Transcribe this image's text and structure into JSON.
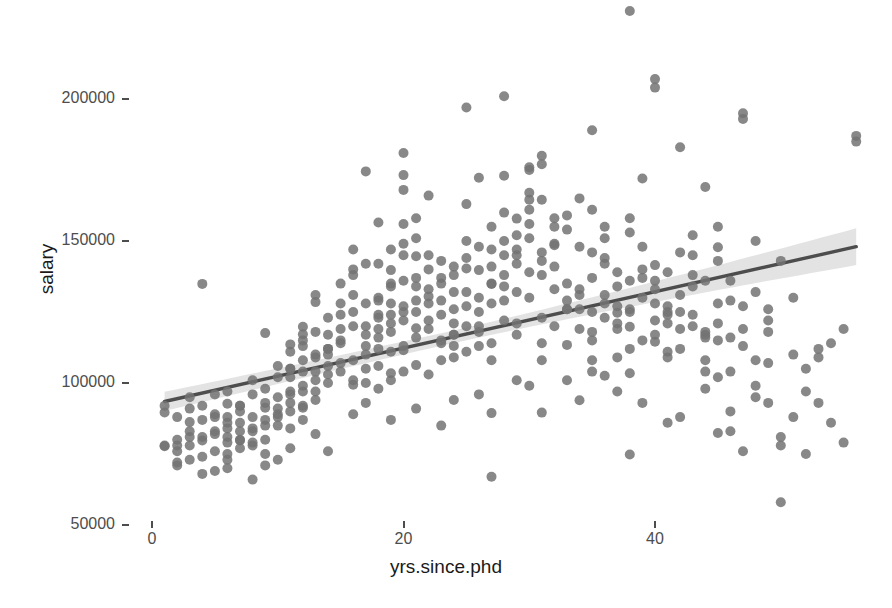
{
  "chart_data": {
    "type": "scatter",
    "title": "",
    "xlabel": "yrs.since.phd",
    "ylabel": "salary",
    "xlim": [
      -1.5,
      57.5
    ],
    "ylim": [
      45000,
      235000
    ],
    "x_ticks": [
      0,
      20,
      40
    ],
    "x_tick_labels": [
      "0",
      "20",
      "40"
    ],
    "y_ticks": [
      50000,
      100000,
      150000,
      200000
    ],
    "y_tick_labels": [
      "50000",
      "100000",
      "150000",
      "200000"
    ],
    "grid": false,
    "legend": "none",
    "point_color": "#737373",
    "point_opacity": 0.85,
    "point_radius": 5,
    "smooth": {
      "method": "lm",
      "line_color": "#4d4d4d",
      "band_color": "#d9d9d9",
      "x_start": 1,
      "x_end": 56,
      "y_start": 93500,
      "y_end": 148000,
      "band_halfwidth_start": 4200,
      "band_halfwidth_mid": 2200,
      "band_halfwidth_end": 6500
    },
    "points": [
      [
        19,
        139750
      ],
      [
        20,
        173200
      ],
      [
        4,
        79750
      ],
      [
        45,
        115000
      ],
      [
        40,
        141500
      ],
      [
        6,
        97000
      ],
      [
        30,
        175000
      ],
      [
        45,
        147765
      ],
      [
        21,
        119250
      ],
      [
        18,
        129000
      ],
      [
        12,
        119800
      ],
      [
        7,
        79800
      ],
      [
        1,
        77700
      ],
      [
        2,
        78000
      ],
      [
        20,
        104000
      ],
      [
        12,
        117150
      ],
      [
        19,
        101000
      ],
      [
        38,
        103450
      ],
      [
        37,
        124750
      ],
      [
        39,
        137000
      ],
      [
        31,
        89565
      ],
      [
        36,
        102580
      ],
      [
        34,
        93904
      ],
      [
        24,
        113068
      ],
      [
        38,
        74830
      ],
      [
        21,
        106294
      ],
      [
        4,
        134885
      ],
      [
        45,
        82379
      ],
      [
        11,
        77000
      ],
      [
        3,
        86250
      ],
      [
        11,
        113600
      ],
      [
        6,
        92700
      ],
      [
        1,
        89600
      ],
      [
        8,
        101000
      ],
      [
        12,
        91300
      ],
      [
        6,
        88000
      ],
      [
        40,
        114500
      ],
      [
        20,
        125000
      ],
      [
        26,
        139750
      ],
      [
        17,
        174500
      ],
      [
        9,
        117555
      ],
      [
        41,
        123999
      ],
      [
        13,
        128500
      ],
      [
        18,
        156500
      ],
      [
        30,
        151000
      ],
      [
        19,
        135000
      ],
      [
        29,
        101000
      ],
      [
        16,
        99418
      ],
      [
        20,
        111512
      ],
      [
        9,
        91300
      ],
      [
        2,
        88000
      ],
      [
        41,
        125000
      ],
      [
        38,
        119800
      ],
      [
        11,
        105000
      ],
      [
        5,
        96000
      ],
      [
        22,
        130500
      ],
      [
        33,
        113400
      ],
      [
        27,
        89400
      ],
      [
        40,
        136000
      ],
      [
        25,
        140300
      ],
      [
        19,
        103400
      ],
      [
        10,
        89000
      ],
      [
        27,
        134885
      ],
      [
        44,
        136000
      ],
      [
        17,
        105000
      ],
      [
        16,
        101000
      ],
      [
        24,
        117000
      ],
      [
        3,
        95000
      ],
      [
        28,
        145000
      ],
      [
        32,
        148500
      ],
      [
        7,
        92000
      ],
      [
        14,
        112000
      ],
      [
        21,
        144651
      ],
      [
        35,
        108000
      ],
      [
        12,
        97000
      ],
      [
        48,
        150000
      ],
      [
        38,
        125000
      ],
      [
        42,
        119000
      ],
      [
        29,
        157875
      ],
      [
        18,
        124000
      ],
      [
        6,
        81000
      ],
      [
        23,
        114000
      ],
      [
        31,
        164500
      ],
      [
        36,
        155000
      ],
      [
        49,
        93000
      ],
      [
        13,
        110000
      ],
      [
        11,
        105000
      ],
      [
        8,
        78000
      ],
      [
        26,
        172272
      ],
      [
        20,
        145000
      ],
      [
        16,
        138000
      ],
      [
        5,
        83000
      ],
      [
        33,
        126000
      ],
      [
        43,
        138000
      ],
      [
        27,
        108000
      ],
      [
        18,
        119000
      ],
      [
        22,
        128000
      ],
      [
        35,
        146000
      ],
      [
        11,
        97000
      ],
      [
        15,
        115000
      ],
      [
        30,
        164500
      ],
      [
        41,
        121000
      ],
      [
        9,
        85000
      ],
      [
        7,
        90000
      ],
      [
        24,
        132000
      ],
      [
        28,
        150000
      ],
      [
        37,
        134000
      ],
      [
        19,
        121000
      ],
      [
        13,
        104000
      ],
      [
        4,
        92000
      ],
      [
        46,
        129000
      ],
      [
        21,
        158000
      ],
      [
        25,
        127000
      ],
      [
        34,
        119000
      ],
      [
        10,
        95000
      ],
      [
        17,
        113000
      ],
      [
        39,
        172000
      ],
      [
        23,
        135000
      ],
      [
        32,
        155000
      ],
      [
        14,
        100000
      ],
      [
        6,
        79000
      ],
      [
        29,
        142000
      ],
      [
        44,
        117000
      ],
      [
        12,
        108000
      ],
      [
        20,
        149000
      ],
      [
        36,
        131000
      ],
      [
        8,
        84000
      ],
      [
        26,
        120000
      ],
      [
        47,
        195000
      ],
      [
        15,
        124000
      ],
      [
        22,
        166000
      ],
      [
        31,
        138000
      ],
      [
        5,
        76000
      ],
      [
        18,
        130000
      ],
      [
        40,
        204000
      ],
      [
        11,
        93000
      ],
      [
        27,
        147000
      ],
      [
        38,
        112000
      ],
      [
        16,
        140000
      ],
      [
        3,
        81000
      ],
      [
        33,
        126000
      ],
      [
        42,
        183000
      ],
      [
        24,
        109000
      ],
      [
        9,
        87000
      ],
      [
        30,
        176000
      ],
      [
        13,
        118000
      ],
      [
        45,
        128000
      ],
      [
        21,
        151000
      ],
      [
        35,
        125000
      ],
      [
        7,
        83000
      ],
      [
        19,
        111000
      ],
      [
        28,
        134000
      ],
      [
        43,
        145000
      ],
      [
        1,
        78000
      ],
      [
        25,
        163000
      ],
      [
        37,
        121000
      ],
      [
        14,
        103000
      ],
      [
        32,
        158000
      ],
      [
        10,
        91000
      ],
      [
        49,
        107000
      ],
      [
        23,
        143000
      ],
      [
        41,
        139000
      ],
      [
        17,
        128000
      ],
      [
        4,
        74000
      ],
      [
        29,
        117000
      ],
      [
        34,
        148000
      ],
      [
        12,
        99000
      ],
      [
        20,
        168000
      ],
      [
        46,
        90000
      ],
      [
        8,
        88000
      ],
      [
        26,
        130000
      ],
      [
        39,
        115000
      ],
      [
        15,
        135000
      ],
      [
        2,
        80000
      ],
      [
        31,
        180000
      ],
      [
        44,
        108000
      ],
      [
        22,
        122000
      ],
      [
        36,
        142000
      ],
      [
        11,
        102000
      ],
      [
        6,
        86000
      ],
      [
        27,
        155000
      ],
      [
        48,
        95000
      ],
      [
        18,
        116000
      ],
      [
        40,
        133000
      ],
      [
        13,
        94000
      ],
      [
        30,
        161000
      ],
      [
        24,
        126000
      ],
      [
        9,
        80000
      ],
      [
        42,
        112000
      ],
      [
        16,
        147000
      ],
      [
        33,
        129000
      ],
      [
        21,
        137000
      ],
      [
        5,
        89000
      ],
      [
        28,
        173000
      ],
      [
        47,
        119000
      ],
      [
        19,
        124000
      ],
      [
        38,
        153000
      ],
      [
        14,
        110000
      ],
      [
        35,
        118000
      ],
      [
        7,
        77000
      ],
      [
        25,
        144000
      ],
      [
        45,
        102000
      ],
      [
        10,
        106000
      ],
      [
        29,
        132000
      ],
      [
        50,
        78000
      ],
      [
        23,
        115000
      ],
      [
        41,
        127000
      ],
      [
        17,
        120000
      ],
      [
        3,
        83000
      ],
      [
        32,
        141000
      ],
      [
        12,
        113000
      ],
      [
        46,
        136000
      ],
      [
        20,
        156000
      ],
      [
        37,
        109000
      ],
      [
        8,
        96000
      ],
      [
        27,
        128000
      ],
      [
        51,
        110000
      ],
      [
        15,
        107000
      ],
      [
        34,
        165000
      ],
      [
        22,
        133000
      ],
      [
        43,
        124000
      ],
      [
        11,
        90000
      ],
      [
        31,
        146000
      ],
      [
        6,
        75000
      ],
      [
        26,
        118000
      ],
      [
        52,
        105000
      ],
      [
        18,
        142000
      ],
      [
        39,
        130000
      ],
      [
        13,
        101000
      ],
      [
        36,
        151000
      ],
      [
        24,
        121000
      ],
      [
        4,
        87000
      ],
      [
        30,
        139000
      ],
      [
        48,
        99000
      ],
      [
        16,
        125000
      ],
      [
        44,
        116000
      ],
      [
        21,
        129000
      ],
      [
        9,
        98000
      ],
      [
        28,
        160000
      ],
      [
        53,
        93000
      ],
      [
        19,
        134000
      ],
      [
        40,
        122000
      ],
      [
        14,
        112000
      ],
      [
        33,
        154000
      ],
      [
        23,
        108000
      ],
      [
        5,
        82000
      ],
      [
        29,
        145000
      ],
      [
        49,
        126000
      ],
      [
        17,
        117000
      ],
      [
        42,
        131000
      ],
      [
        12,
        104000
      ],
      [
        35,
        137000
      ],
      [
        25,
        150000
      ],
      [
        10,
        85000
      ],
      [
        31,
        123000
      ],
      [
        54,
        86000
      ],
      [
        20,
        113000
      ],
      [
        45,
        143000
      ],
      [
        15,
        119000
      ],
      [
        37,
        127000
      ],
      [
        22,
        140000
      ],
      [
        7,
        92000
      ],
      [
        27,
        114000
      ],
      [
        50,
        81000
      ],
      [
        18,
        106000
      ],
      [
        38,
        158000
      ],
      [
        13,
        97000
      ],
      [
        34,
        133000
      ],
      [
        26,
        125000
      ],
      [
        2,
        76000
      ],
      [
        32,
        149000
      ],
      [
        47,
        113000
      ],
      [
        16,
        131000
      ],
      [
        43,
        120000
      ],
      [
        21,
        116000
      ],
      [
        8,
        79000
      ],
      [
        30,
        167000
      ],
      [
        55,
        119000
      ],
      [
        24,
        138000
      ],
      [
        41,
        109000
      ],
      [
        11,
        111000
      ],
      [
        36,
        144000
      ],
      [
        28,
        122000
      ],
      [
        6,
        84000
      ],
      [
        33,
        135000
      ],
      [
        51,
        88000
      ],
      [
        19,
        147000
      ],
      [
        46,
        104000
      ],
      [
        14,
        123000
      ],
      [
        39,
        140000
      ],
      [
        23,
        129000
      ],
      [
        3,
        73000
      ],
      [
        29,
        152000
      ],
      [
        44,
        118000
      ],
      [
        17,
        100000
      ],
      [
        40,
        128000
      ],
      [
        12,
        115000
      ],
      [
        35,
        161000
      ],
      [
        25,
        111000
      ],
      [
        9,
        93000
      ],
      [
        48,
        132000
      ],
      [
        56,
        187000
      ],
      [
        20,
        136000
      ],
      [
        31,
        114000
      ],
      [
        15,
        128000
      ],
      [
        42,
        146000
      ],
      [
        22,
        103000
      ],
      [
        4,
        81000
      ],
      [
        27,
        141000
      ],
      [
        52,
        97000
      ],
      [
        18,
        112000
      ],
      [
        37,
        119000
      ],
      [
        13,
        131000
      ],
      [
        34,
        126000
      ],
      [
        24,
        117000
      ],
      [
        5,
        88000
      ],
      [
        30,
        130000
      ],
      [
        49,
        122000
      ],
      [
        16,
        108000
      ],
      [
        45,
        155000
      ],
      [
        21,
        125000
      ],
      [
        10,
        102000
      ],
      [
        38,
        136000
      ],
      [
        26,
        148000
      ],
      [
        7,
        86000
      ],
      [
        32,
        120000
      ],
      [
        47,
        127000
      ],
      [
        19,
        118000
      ],
      [
        43,
        134000
      ],
      [
        14,
        106000
      ],
      [
        36,
        123000
      ],
      [
        23,
        137000
      ],
      [
        2,
        71000
      ],
      [
        28,
        129000
      ],
      [
        50,
        143000
      ],
      [
        17,
        142000
      ],
      [
        41,
        111000
      ],
      [
        11,
        96000
      ],
      [
        33,
        159000
      ],
      [
        25,
        132000
      ],
      [
        6,
        73000
      ],
      [
        29,
        121000
      ],
      [
        53,
        112000
      ],
      [
        20,
        127000
      ],
      [
        46,
        116000
      ],
      [
        15,
        114000
      ],
      [
        39,
        148000
      ],
      [
        22,
        119000
      ],
      [
        8,
        83000
      ],
      [
        27,
        135000
      ],
      [
        44,
        104000
      ],
      [
        18,
        123000
      ],
      [
        35,
        115000
      ],
      [
        12,
        87000
      ],
      [
        31,
        143000
      ],
      [
        24,
        141000
      ],
      [
        9,
        75000
      ],
      [
        40,
        117000
      ],
      [
        48,
        108000
      ],
      [
        16,
        120000
      ],
      [
        42,
        125000
      ],
      [
        21,
        134000
      ],
      [
        13,
        109000
      ],
      [
        37,
        139000
      ],
      [
        26,
        113000
      ],
      [
        3,
        78000
      ],
      [
        30,
        156000
      ],
      [
        51,
        130000
      ],
      [
        19,
        128000
      ],
      [
        45,
        121000
      ],
      [
        14,
        117000
      ],
      [
        34,
        131000
      ],
      [
        23,
        124000
      ],
      [
        7,
        80000
      ],
      [
        28,
        138000
      ],
      [
        49,
        118000
      ],
      [
        17,
        110000
      ],
      [
        38,
        126000
      ],
      [
        10,
        88000
      ],
      [
        32,
        133000
      ],
      [
        25,
        120000
      ],
      [
        5,
        69000
      ],
      [
        29,
        147000
      ],
      [
        54,
        114000
      ],
      [
        20,
        122000
      ],
      [
        43,
        152000
      ],
      [
        15,
        104000
      ],
      [
        36,
        128000
      ],
      [
        22,
        145000
      ],
      [
        11,
        84000
      ],
      [
        27,
        67000
      ],
      [
        47,
        76000
      ],
      [
        18,
        98000
      ],
      [
        41,
        86000
      ],
      [
        12,
        92000
      ],
      [
        33,
        101000
      ],
      [
        24,
        94000
      ],
      [
        4,
        68000
      ],
      [
        31,
        108000
      ],
      [
        52,
        75000
      ],
      [
        16,
        89000
      ],
      [
        44,
        98000
      ],
      [
        21,
        91000
      ],
      [
        9,
        71000
      ],
      [
        39,
        93000
      ],
      [
        26,
        96000
      ],
      [
        8,
        66000
      ],
      [
        35,
        104000
      ],
      [
        50,
        58000
      ],
      [
        13,
        82000
      ],
      [
        46,
        83000
      ],
      [
        19,
        87000
      ],
      [
        37,
        97000
      ],
      [
        23,
        85000
      ],
      [
        6,
        70000
      ],
      [
        30,
        99000
      ],
      [
        55,
        79000
      ],
      [
        17,
        93000
      ],
      [
        42,
        88000
      ],
      [
        14,
        76000
      ],
      [
        40,
        207000
      ],
      [
        28,
        201000
      ],
      [
        38,
        231000
      ],
      [
        47,
        193000
      ],
      [
        56,
        185000
      ],
      [
        25,
        197000
      ],
      [
        35,
        189000
      ],
      [
        20,
        181000
      ],
      [
        31,
        177000
      ],
      [
        44,
        169000
      ],
      [
        53,
        109000
      ],
      [
        10,
        73000
      ],
      [
        2,
        72000
      ],
      [
        1,
        92000
      ],
      [
        3,
        91000
      ]
    ]
  }
}
